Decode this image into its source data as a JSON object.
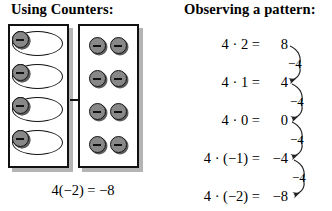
{
  "headings": {
    "counters": "Using Counters:",
    "pattern": "Observing a pattern:"
  },
  "counters_model": {
    "grouped_box": {
      "name": "four-groups-of-two-negatives",
      "group_count": 4,
      "chips_per_group": 2,
      "chip_sign": "−",
      "chip_label": "negative-counter"
    },
    "flat_box": {
      "name": "eight-negatives",
      "row_count": 4,
      "chips_per_row": 2,
      "total_chips": 8,
      "chip_sign": "−",
      "chip_label": "negative-counter"
    },
    "transition_arrow": "right-arrow",
    "equation": "4(−2) = −8"
  },
  "pattern_model": {
    "rows": [
      {
        "lhs": "4 · 2 =",
        "rhs": "8"
      },
      {
        "lhs": "4 · 1 =",
        "rhs": "4"
      },
      {
        "lhs": "4 · 0 =",
        "rhs": "0"
      },
      {
        "lhs": "4 · (−1) =",
        "rhs": "−4"
      },
      {
        "lhs": "4 · (−2) =",
        "rhs": "−8"
      }
    ],
    "deltas": [
      "−4",
      "−4",
      "−4",
      "−4"
    ],
    "delta_arrow": "curved-down-left-arrow"
  },
  "colors": {
    "ink": "#000000",
    "chip_fill": "#888888",
    "chip_edge": "#141414",
    "chip_shadow": "#5d5d5d",
    "box_shadow": "#b4b4b4",
    "paper": "#ffffff"
  }
}
